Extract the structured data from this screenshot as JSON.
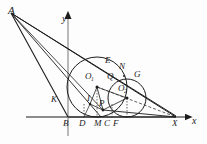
{
  "figure": {
    "type": "plane-geometry-diagram",
    "background_color": "#fdfdfd",
    "stroke_color": "#1c1c1c",
    "axes": {
      "x_axis_label": "x",
      "y_axis_label": "y",
      "origin_label": "",
      "x_axis_y_px": 117,
      "y_axis_x_px": 68
    },
    "points": [
      {
        "id": "A",
        "label": "A",
        "x": 11,
        "y": 13,
        "lx": 8,
        "ly": 5
      },
      {
        "id": "E",
        "label": "E",
        "x": 110,
        "y": 70,
        "lx": 105,
        "ly": 56
      },
      {
        "id": "N",
        "label": "N",
        "x": 124,
        "y": 76,
        "lx": 119,
        "ly": 62
      },
      {
        "id": "G",
        "label": "G",
        "x": 139,
        "y": 84,
        "lx": 134,
        "ly": 70
      },
      {
        "id": "O1",
        "label": "O",
        "sub": "1",
        "x": 97,
        "y": 87,
        "lx": 85,
        "ly": 72
      },
      {
        "id": "Q",
        "label": "Q",
        "x": 112,
        "y": 87,
        "lx": 107,
        "ly": 72
      },
      {
        "id": "O2",
        "label": "O",
        "sub": "2",
        "x": 127,
        "y": 98,
        "lx": 118,
        "ly": 84
      },
      {
        "id": "K",
        "label": "K",
        "x": 60,
        "y": 103,
        "lx": 51,
        "ly": 96
      },
      {
        "id": "I",
        "label": "I",
        "x": 90,
        "y": 104,
        "lx": 86,
        "ly": 95
      },
      {
        "id": "P",
        "label": "P",
        "x": 103,
        "y": 110,
        "lx": 99,
        "ly": 100
      },
      {
        "id": "B",
        "label": "B",
        "x": 68,
        "y": 117,
        "lx": 63,
        "ly": 119
      },
      {
        "id": "D",
        "label": "D",
        "x": 84,
        "y": 117,
        "lx": 79,
        "ly": 119
      },
      {
        "id": "M",
        "label": "M",
        "x": 101,
        "y": 117,
        "lx": 95,
        "ly": 119
      },
      {
        "id": "C",
        "label": "C",
        "x": 112,
        "y": 117,
        "lx": 107,
        "ly": 119
      },
      {
        "id": "F",
        "label": "F",
        "x": 122,
        "y": 117,
        "lx": 117,
        "ly": 119
      },
      {
        "id": "X",
        "label": "X",
        "x": 176,
        "y": 117,
        "lx": 172,
        "ly": 119
      }
    ],
    "axis_labels": [
      {
        "id": "y-axis-label",
        "label": "y",
        "lx": 62,
        "ly": 14
      },
      {
        "id": "x-axis-label",
        "label": "x",
        "lx": 192,
        "ly": 118
      }
    ],
    "circles": [
      {
        "id": "circle-O1",
        "center_label": "O1",
        "cx": 97,
        "cy": 87,
        "r": 30,
        "style": "solid"
      },
      {
        "id": "circle-O2",
        "center_label": "O2",
        "cx": 127,
        "cy": 98,
        "r": 19,
        "style": "solid"
      }
    ],
    "segments": [
      {
        "id": "A-to-X",
        "from": "A",
        "to": "X",
        "style": "solid"
      },
      {
        "id": "A-to-E",
        "from": "A",
        "to": "E",
        "style": "solid"
      },
      {
        "id": "A-to-B",
        "from": "A",
        "to": "B",
        "style": "solid"
      },
      {
        "id": "A-to-M",
        "from": "A",
        "to": "M",
        "style": "solid"
      },
      {
        "id": "B-to-X",
        "from": "B",
        "to": "X",
        "style": "solid"
      },
      {
        "id": "O1-to-D",
        "from": "O1",
        "to": "D",
        "style": "dotted"
      },
      {
        "id": "O2-to-F",
        "from": "O2",
        "to": "F",
        "style": "dotted"
      },
      {
        "id": "O1-to-X",
        "from": "O1",
        "to": "X",
        "style": "dashed"
      },
      {
        "id": "O1-to-P",
        "from": "O1",
        "to": "P",
        "style": "solid"
      },
      {
        "id": "O1-to-I",
        "from": "O1",
        "to": "I",
        "style": "solid"
      },
      {
        "id": "O2-to-P",
        "from": "O2",
        "to": "P",
        "style": "solid"
      },
      {
        "id": "P-to-X",
        "from": "P",
        "to": "X",
        "style": "solid"
      }
    ]
  }
}
